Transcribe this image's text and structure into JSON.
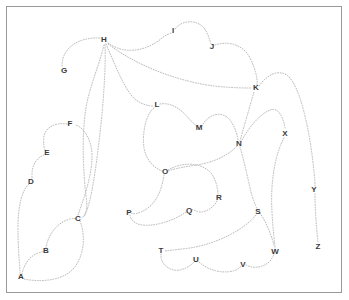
{
  "canvas": {
    "width": 349,
    "height": 300,
    "background": "#ffffff",
    "border_color": "#9a9a9a",
    "edge_color": "#b9b9b9",
    "label_color": "#3a3a3a",
    "title": "Labeled curve network diagram"
  },
  "nodes": [
    {
      "id": "A",
      "label": "A",
      "x": 21,
      "y": 277
    },
    {
      "id": "B",
      "label": "B",
      "x": 46,
      "y": 251
    },
    {
      "id": "C",
      "label": "C",
      "x": 78,
      "y": 219
    },
    {
      "id": "D",
      "label": "D",
      "x": 31,
      "y": 182
    },
    {
      "id": "E",
      "label": "E",
      "x": 47,
      "y": 153
    },
    {
      "id": "F",
      "label": "F",
      "x": 70,
      "y": 124
    },
    {
      "id": "G",
      "label": "G",
      "x": 64,
      "y": 71
    },
    {
      "id": "H",
      "label": "H",
      "x": 104,
      "y": 40
    },
    {
      "id": "I",
      "label": "I",
      "x": 173,
      "y": 31
    },
    {
      "id": "J",
      "label": "J",
      "x": 212,
      "y": 47
    },
    {
      "id": "K",
      "label": "K",
      "x": 256,
      "y": 88
    },
    {
      "id": "L",
      "label": "L",
      "x": 157,
      "y": 105
    },
    {
      "id": "M",
      "label": "M",
      "x": 199,
      "y": 128
    },
    {
      "id": "N",
      "label": "N",
      "x": 239,
      "y": 144
    },
    {
      "id": "O",
      "label": "O",
      "x": 165,
      "y": 172
    },
    {
      "id": "P",
      "label": "P",
      "x": 129,
      "y": 213
    },
    {
      "id": "Q",
      "label": "Q",
      "x": 189,
      "y": 211
    },
    {
      "id": "R",
      "label": "R",
      "x": 219,
      "y": 198
    },
    {
      "id": "S",
      "label": "S",
      "x": 258,
      "y": 212
    },
    {
      "id": "T",
      "label": "T",
      "x": 161,
      "y": 251
    },
    {
      "id": "U",
      "label": "U",
      "x": 196,
      "y": 260
    },
    {
      "id": "V",
      "label": "V",
      "x": 243,
      "y": 265
    },
    {
      "id": "W",
      "label": "W",
      "x": 275,
      "y": 252
    },
    {
      "id": "X",
      "label": "X",
      "x": 285,
      "y": 134
    },
    {
      "id": "Y",
      "label": "Y",
      "x": 314,
      "y": 190
    },
    {
      "id": "Z",
      "label": "Z",
      "x": 318,
      "y": 247
    }
  ],
  "edges": [
    {
      "from": "G",
      "to": "H",
      "d": "M 62 66 C 62 48 78 37 100 38"
    },
    {
      "from": "H",
      "to": "G2",
      "d": "M 104 45 C 100 62 93 78 88 98 C 82 122 82 160 86 196 C 88 208 86 214 82 218"
    },
    {
      "from": "H",
      "to": "C",
      "d": "M 105 45 C 106 70 103 110 98 150 C 94 182 90 206 84 217"
    },
    {
      "from": "H",
      "to": "L",
      "d": "M 106 44 C 118 72 126 92 136 100 C 143 105 150 106 153 106"
    },
    {
      "from": "H",
      "to": "I",
      "d": "M 108 43 C 126 56 148 50 162 38 C 166 35 170 33 172 33"
    },
    {
      "from": "H",
      "to": "K",
      "d": "M 108 44 C 140 68 182 82 214 86 C 232 88 246 88 252 88"
    },
    {
      "from": "I",
      "to": "J",
      "d": "M 175 29 C 182 20 196 19 204 28 C 208 33 210 41 211 44"
    },
    {
      "from": "J",
      "to": "K",
      "d": "M 215 45 C 230 40 244 46 250 58 C 256 70 258 81 257 85"
    },
    {
      "from": "K",
      "to": "Y",
      "d": "M 259 86 C 266 76 278 68 288 76 C 300 86 310 130 314 172 C 315 180 315 186 315 187"
    },
    {
      "from": "Y",
      "to": "Z",
      "d": "M 315 194 C 315 212 317 232 318 243"
    },
    {
      "from": "L",
      "to": "O",
      "d": "M 154 108 C 146 114 142 132 144 148 C 146 160 154 168 162 171"
    },
    {
      "from": "L",
      "to": "M",
      "d": "M 160 104 C 172 102 182 110 190 120 C 194 124 197 126 197 127"
    },
    {
      "from": "M",
      "to": "N",
      "d": "M 202 126 C 208 114 222 110 230 120 C 236 128 238 138 238 141"
    },
    {
      "from": "N",
      "to": "K",
      "d": "M 240 141 C 244 126 250 106 254 92"
    },
    {
      "from": "N",
      "to": "X",
      "d": "M 241 142 C 248 128 260 114 270 110 C 278 107 283 116 285 128"
    },
    {
      "from": "N",
      "to": "O",
      "d": "M 237 146 C 226 158 208 164 190 166 C 178 168 170 170 168 171"
    },
    {
      "from": "N",
      "to": "S",
      "d": "M 240 147 C 244 160 248 180 252 196 C 255 204 257 209 257 209"
    },
    {
      "from": "O",
      "to": "R",
      "d": "M 168 170 C 182 162 200 162 210 172 C 216 178 218 190 218 194"
    },
    {
      "from": "O",
      "to": "P",
      "d": "M 164 175 C 162 188 158 200 148 208 C 138 215 132 214 131 213"
    },
    {
      "from": "R",
      "to": "Q",
      "d": "M 217 201 C 212 210 202 214 196 211 C 193 209 191 210 191 210"
    },
    {
      "from": "Q",
      "to": "P",
      "d": "M 186 212 C 172 222 150 228 138 224 C 132 222 130 217 130 215"
    },
    {
      "from": "S",
      "to": "T",
      "d": "M 256 215 C 244 230 216 244 190 248 C 174 250 165 251 164 251"
    },
    {
      "from": "S",
      "to": "W",
      "d": "M 260 213 C 266 222 272 236 274 246"
    },
    {
      "from": "X",
      "to": "W",
      "d": "M 284 138 C 276 152 270 180 272 212 C 273 232 275 245 275 248"
    },
    {
      "from": "T",
      "to": "U",
      "d": "M 161 254 C 160 264 170 272 180 270 C 188 268 192 264 194 262"
    },
    {
      "from": "U",
      "to": "V",
      "d": "M 199 262 C 210 272 226 274 236 270 C 240 268 241 266 241 266"
    },
    {
      "from": "V",
      "to": "W",
      "d": "M 246 265 C 256 270 268 266 272 258 C 274 255 274 254 274 254"
    },
    {
      "from": "C",
      "to": "F",
      "d": "M 78 215 C 84 198 92 176 92 156 C 92 140 84 128 76 125"
    },
    {
      "from": "F",
      "to": "E",
      "d": "M 67 124 C 54 122 46 128 44 136 C 43 142 44 148 45 150"
    },
    {
      "from": "E",
      "to": "D",
      "d": "M 44 155 C 36 158 32 166 32 174 C 32 177 32 179 32 179"
    },
    {
      "from": "D",
      "to": "A",
      "d": "M 29 184 C 22 190 18 206 18 228 C 18 252 20 268 20 273"
    },
    {
      "from": "A",
      "to": "B",
      "d": "M 22 274 C 24 264 30 256 38 253 C 42 252 44 251 44 251"
    },
    {
      "from": "B",
      "to": "C",
      "d": "M 46 248 C 48 234 58 222 70 219 C 74 218 76 219 76 219"
    },
    {
      "from": "C",
      "to": "A",
      "d": "M 80 221 C 86 236 84 256 74 268 C 62 282 38 282 24 279"
    }
  ]
}
